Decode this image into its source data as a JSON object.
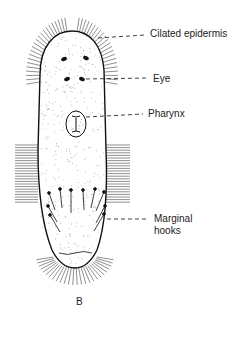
{
  "figure": {
    "panel_label": "B"
  },
  "labels": [
    {
      "id": "ciliated-epidermis",
      "text": "Cilated epidermis",
      "x": 150,
      "y": 28
    },
    {
      "id": "eye",
      "text": "Eye",
      "x": 153,
      "y": 71
    },
    {
      "id": "pharynx",
      "text": "Pharynx",
      "x": 148,
      "y": 107
    },
    {
      "id": "marginal-hooks-1",
      "text": "Marginal",
      "x": 154,
      "y": 217
    },
    {
      "id": "marginal-hooks-2",
      "text": "hooks",
      "x": 154,
      "y": 229
    }
  ],
  "colors": {
    "ink": "#1a1a1a",
    "background": "#ffffff"
  }
}
